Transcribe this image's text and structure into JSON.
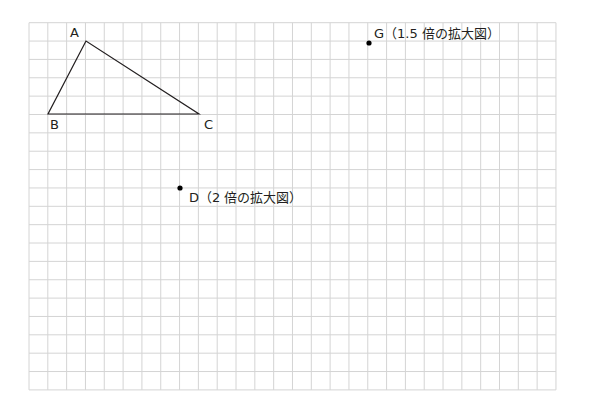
{
  "grid": {
    "left": 29,
    "top": 22.7,
    "cols": 28,
    "rows": 20,
    "cell_w": 18.82,
    "cell_h": 18.36,
    "line_color": "#d4d4d4"
  },
  "triangle": {
    "stroke": "#231f20",
    "points": {
      "A": {
        "label": "A",
        "x": 86,
        "y": 41
      },
      "B": {
        "label": "B",
        "x": 48,
        "y": 114
      },
      "C": {
        "label": "C",
        "x": 199,
        "y": 114
      }
    }
  },
  "points": {
    "D": {
      "label": "D（2 倍の拡大図）",
      "x": 180,
      "y": 188
    },
    "G": {
      "label": "G（1.5 倍の拡大図）",
      "x": 369,
      "y": 43
    }
  }
}
